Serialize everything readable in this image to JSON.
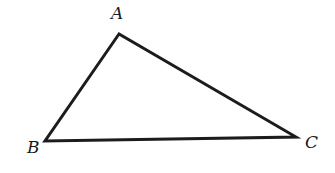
{
  "diagram": {
    "type": "triangle",
    "stroke_color": "#1c1c1c",
    "background": "#ffffff",
    "vertices": [
      {
        "id": "A",
        "label": "A",
        "x": 119,
        "y": 34,
        "label_x": 111,
        "label_y": 19
      },
      {
        "id": "B",
        "label": "B",
        "x": 45,
        "y": 141,
        "label_x": 27,
        "label_y": 153
      },
      {
        "id": "C",
        "label": "C",
        "x": 296,
        "y": 137,
        "label_x": 305,
        "label_y": 148
      }
    ],
    "edges": [
      {
        "from": "A",
        "to": "B"
      },
      {
        "from": "B",
        "to": "C"
      },
      {
        "from": "C",
        "to": "A"
      }
    ]
  }
}
